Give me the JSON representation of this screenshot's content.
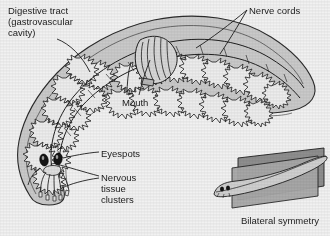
{
  "figure": {
    "background_color": "#f1f1f1",
    "body_fill_color": "#c9c9c9",
    "body_outline_color": "#2b2b2b",
    "organ_fill_color": "#e8e8e8",
    "plane_fill_color": "#9a9a9a",
    "text_color": "#1c1c1c"
  },
  "labels": {
    "digestive_tract": "Digestive tract\n(gastrovascular\ncavity)",
    "nerve_cords": "Nerve cords",
    "mouth": "Mouth",
    "eyespots": "Eyespots",
    "nervous_tissue_clusters": "Nervous\ntissue\nclusters",
    "bilateral_symmetry": "Bilateral symmetry"
  },
  "structures": [
    {
      "name": "digestive-tract",
      "label": "Digestive tract (gastrovascular cavity)"
    },
    {
      "name": "nerve-cords",
      "label": "Nerve cords"
    },
    {
      "name": "mouth",
      "label": "Mouth"
    },
    {
      "name": "eyespots",
      "label": "Eyespots"
    },
    {
      "name": "nervous-tissue-clusters",
      "label": "Nervous tissue clusters"
    },
    {
      "name": "bilateral-symmetry-inset",
      "label": "Bilateral symmetry"
    }
  ]
}
